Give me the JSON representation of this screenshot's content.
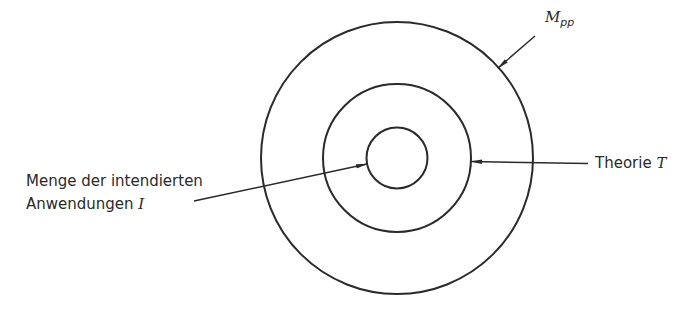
{
  "diagram": {
    "type": "nested-circles",
    "stroke_color": "#2a2a2a",
    "circles": [
      {
        "name": "outer",
        "cx": 397,
        "cy": 158,
        "r": 136,
        "label_ref": "mpp"
      },
      {
        "name": "middle",
        "cx": 397,
        "cy": 158,
        "r": 74,
        "label_ref": "theorie"
      },
      {
        "name": "inner",
        "cx": 397,
        "cy": 158,
        "r": 30,
        "label_ref": "anwendungen"
      }
    ],
    "labels": {
      "mpp": {
        "main": "M",
        "sub": "pp"
      },
      "theorie": {
        "text": "Theorie ",
        "symbol": "T"
      },
      "anwendungen": {
        "line1": "Menge der intendierten",
        "line2": "Anwendungen ",
        "symbol": "I"
      }
    }
  }
}
